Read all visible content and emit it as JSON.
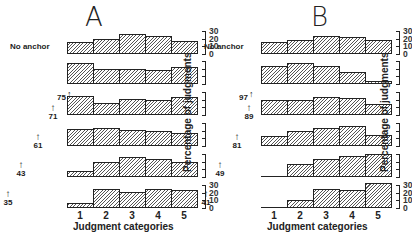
{
  "chart_data": [
    {
      "type": "bar",
      "title": "A",
      "xlabel": "Judgment categories",
      "ylabel": "Percentage of judgments",
      "categories": [
        "1",
        "2",
        "3",
        "4",
        "5"
      ],
      "ylim": [
        0,
        30
      ],
      "yticks": [
        "30",
        "20",
        "10",
        "0"
      ],
      "series": [
        {
          "name": "No anchor",
          "values": [
            16,
            20,
            26,
            24,
            17
          ]
        },
        {
          "name": "75",
          "values": [
            27,
            19,
            20,
            18,
            22
          ]
        },
        {
          "name": "71",
          "values": [
            25,
            16,
            21,
            19,
            24
          ]
        },
        {
          "name": "61",
          "values": [
            22,
            23,
            21,
            19,
            17
          ]
        },
        {
          "name": "43",
          "values": [
            8,
            20,
            26,
            24,
            19
          ]
        },
        {
          "name": "35",
          "values": [
            6,
            25,
            21,
            25,
            24
          ]
        }
      ],
      "anchor_labels": [
        "75",
        "71",
        "61",
        "43",
        "35"
      ]
    },
    {
      "type": "bar",
      "title": "B",
      "xlabel": "Judgment categories",
      "ylabel": "Percentage of judgments",
      "categories": [
        "1",
        "2",
        "3",
        "4",
        "5"
      ],
      "ylim": [
        0,
        30
      ],
      "yticks": [
        "30",
        "20",
        "10",
        "0"
      ],
      "series": [
        {
          "name": "No anchor",
          "values": [
            16,
            18,
            24,
            22,
            18
          ]
        },
        {
          "name": "97",
          "values": [
            24,
            28,
            24,
            16,
            4
          ]
        },
        {
          "name": "89",
          "values": [
            20,
            19,
            24,
            22,
            14
          ]
        },
        {
          "name": "81",
          "values": [
            13,
            20,
            24,
            26,
            14
          ]
        },
        {
          "name": "49",
          "values": [
            0,
            17,
            23,
            28,
            30
          ]
        },
        {
          "name": "41",
          "values": [
            0,
            10,
            25,
            24,
            33
          ]
        }
      ],
      "anchor_labels": [
        "97",
        "89",
        "81",
        "49",
        "41"
      ]
    }
  ],
  "labels": {
    "no_anchor": "No anchor",
    "arrow": "↑"
  }
}
